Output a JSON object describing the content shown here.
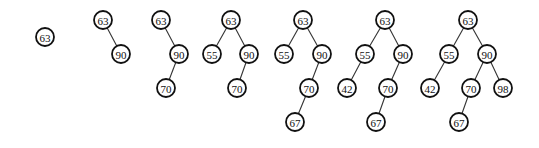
{
  "diagram": {
    "title": "",
    "node_radius": 9,
    "trees": [
      {
        "step": 1,
        "nodes": [
          {
            "id": "a",
            "label": "63",
            "x": 45,
            "y": 37
          }
        ],
        "edges": []
      },
      {
        "step": 2,
        "nodes": [
          {
            "id": "a",
            "label": "63",
            "x": 103,
            "y": 20
          },
          {
            "id": "b",
            "label": "90",
            "x": 121,
            "y": 54
          }
        ],
        "edges": [
          [
            "a",
            "b"
          ]
        ]
      },
      {
        "step": 3,
        "nodes": [
          {
            "id": "a",
            "label": "63",
            "x": 161,
            "y": 20
          },
          {
            "id": "b",
            "label": "90",
            "x": 179,
            "y": 54
          },
          {
            "id": "c",
            "label": "70",
            "x": 166,
            "y": 88
          }
        ],
        "edges": [
          [
            "a",
            "b"
          ],
          [
            "b",
            "c"
          ]
        ]
      },
      {
        "step": 4,
        "nodes": [
          {
            "id": "a",
            "label": "63",
            "x": 231,
            "y": 20
          },
          {
            "id": "d",
            "label": "55",
            "x": 212,
            "y": 54
          },
          {
            "id": "b",
            "label": "90",
            "x": 249,
            "y": 54
          },
          {
            "id": "c",
            "label": "70",
            "x": 237,
            "y": 88
          }
        ],
        "edges": [
          [
            "a",
            "d"
          ],
          [
            "a",
            "b"
          ],
          [
            "b",
            "c"
          ]
        ]
      },
      {
        "step": 5,
        "nodes": [
          {
            "id": "a",
            "label": "63",
            "x": 303,
            "y": 20
          },
          {
            "id": "d",
            "label": "55",
            "x": 284,
            "y": 54
          },
          {
            "id": "b",
            "label": "90",
            "x": 322,
            "y": 54
          },
          {
            "id": "c",
            "label": "70",
            "x": 309,
            "y": 88
          },
          {
            "id": "e",
            "label": "67",
            "x": 295,
            "y": 122
          }
        ],
        "edges": [
          [
            "a",
            "d"
          ],
          [
            "a",
            "b"
          ],
          [
            "b",
            "c"
          ],
          [
            "c",
            "e"
          ]
        ]
      },
      {
        "step": 6,
        "nodes": [
          {
            "id": "a",
            "label": "63",
            "x": 385,
            "y": 20
          },
          {
            "id": "d",
            "label": "55",
            "x": 365,
            "y": 54
          },
          {
            "id": "b",
            "label": "90",
            "x": 403,
            "y": 54
          },
          {
            "id": "f",
            "label": "42",
            "x": 347,
            "y": 88
          },
          {
            "id": "c",
            "label": "70",
            "x": 388,
            "y": 88
          },
          {
            "id": "e",
            "label": "67",
            "x": 376,
            "y": 122
          }
        ],
        "edges": [
          [
            "a",
            "d"
          ],
          [
            "a",
            "b"
          ],
          [
            "d",
            "f"
          ],
          [
            "b",
            "c"
          ],
          [
            "c",
            "e"
          ]
        ]
      },
      {
        "step": 7,
        "nodes": [
          {
            "id": "a",
            "label": "63",
            "x": 468,
            "y": 20
          },
          {
            "id": "d",
            "label": "55",
            "x": 449,
            "y": 54
          },
          {
            "id": "b",
            "label": "90",
            "x": 487,
            "y": 54
          },
          {
            "id": "f",
            "label": "42",
            "x": 430,
            "y": 88
          },
          {
            "id": "c",
            "label": "70",
            "x": 471,
            "y": 88
          },
          {
            "id": "g",
            "label": "98",
            "x": 503,
            "y": 88
          },
          {
            "id": "e",
            "label": "67",
            "x": 459,
            "y": 122
          }
        ],
        "edges": [
          [
            "a",
            "d"
          ],
          [
            "a",
            "b"
          ],
          [
            "d",
            "f"
          ],
          [
            "b",
            "c"
          ],
          [
            "b",
            "g"
          ],
          [
            "c",
            "e"
          ]
        ]
      }
    ]
  }
}
